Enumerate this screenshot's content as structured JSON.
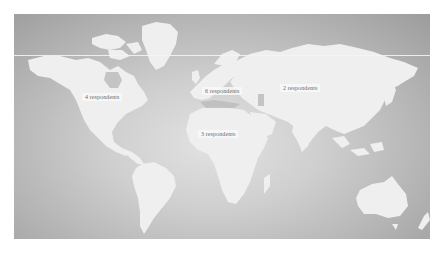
{
  "map": {
    "title": "World map of respondents",
    "colors": {
      "ocean_dark": "#9c9c9c",
      "ocean_light": "#e2e2e2",
      "land": "#f0f0f0",
      "label_text": "#6a6a6a"
    },
    "markers": [
      {
        "region": "North America",
        "label": "4 respondents",
        "count": 4
      },
      {
        "region": "Europe",
        "label": "6 respondents",
        "count": 6
      },
      {
        "region": "Asia",
        "label": "2 respondents",
        "count": 2
      },
      {
        "region": "Africa",
        "label": "3 respondents",
        "count": 3
      }
    ]
  }
}
